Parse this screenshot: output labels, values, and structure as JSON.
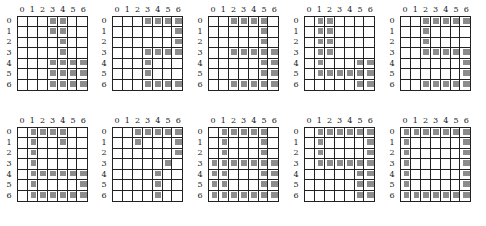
{
  "col_labels": [
    "0",
    "1",
    "2",
    "3",
    "4",
    "5",
    "6"
  ],
  "row_labels": [
    "0",
    "1",
    "2",
    "3",
    "4",
    "5",
    "6"
  ],
  "fill_color": "#8c8c8c",
  "panels": [
    {
      "id": 1,
      "x": 3,
      "y": 5,
      "filled": {
        "0": [
          3,
          4
        ],
        "1": [
          3,
          4
        ],
        "2": [
          4
        ],
        "3": [
          4
        ],
        "4": [
          3,
          4,
          5,
          6
        ],
        "5": [
          3,
          4,
          5,
          6
        ],
        "6": [
          3,
          4,
          5,
          6
        ]
      }
    },
    {
      "id": 2,
      "x": 98,
      "y": 5,
      "filled": {
        "0": [
          3,
          4,
          5,
          6
        ],
        "1": [
          6
        ],
        "2": [
          6
        ],
        "3": [
          3,
          4,
          5,
          6
        ],
        "4": [
          3
        ],
        "5": [
          3
        ],
        "6": [
          3,
          4,
          5,
          6
        ]
      }
    },
    {
      "id": 3,
      "x": 194,
      "y": 5,
      "filled": {
        "0": [
          2,
          3,
          4,
          5
        ],
        "1": [
          5
        ],
        "2": [
          5
        ],
        "3": [
          2,
          3,
          4,
          5,
          6
        ],
        "4": [
          5,
          6
        ],
        "5": [
          5,
          6
        ],
        "6": [
          2,
          3,
          4,
          5,
          6
        ]
      }
    },
    {
      "id": 4,
      "x": 290,
      "y": 5,
      "filled": {
        "0": [
          1,
          2
        ],
        "1": [
          1,
          2
        ],
        "2": [
          1,
          2
        ],
        "3": [
          1,
          2
        ],
        "4": [
          1,
          5,
          6
        ],
        "5": [
          1,
          2,
          3,
          4,
          5,
          6
        ],
        "6": [
          5,
          6
        ]
      }
    },
    {
      "id": 5,
      "x": 386,
      "y": 5,
      "filled": {
        "0": [
          2,
          3,
          4,
          5,
          6
        ],
        "1": [
          2
        ],
        "2": [
          2
        ],
        "3": [
          2,
          3,
          4,
          5,
          6
        ],
        "4": [
          6
        ],
        "5": [
          6
        ],
        "6": [
          2,
          3,
          4,
          5,
          6
        ]
      }
    },
    {
      "id": 6,
      "x": 3,
      "y": 116,
      "filled": {
        "0": [
          1,
          2,
          3,
          4
        ],
        "1": [
          1,
          4
        ],
        "2": [
          1
        ],
        "3": [
          1
        ],
        "4": [
          1,
          2,
          3,
          4,
          5,
          6
        ],
        "5": [
          1,
          6
        ],
        "6": [
          1,
          2,
          3,
          4,
          5,
          6
        ]
      }
    },
    {
      "id": 7,
      "x": 98,
      "y": 116,
      "filled": {
        "0": [
          2,
          3,
          4,
          5,
          6
        ],
        "1": [
          2,
          6
        ],
        "2": [
          6
        ],
        "3": [
          5
        ],
        "4": [
          4
        ],
        "5": [
          4
        ],
        "6": [
          4
        ]
      }
    },
    {
      "id": 8,
      "x": 194,
      "y": 116,
      "filled": {
        "0": [
          1,
          2,
          3,
          4,
          5
        ],
        "1": [
          1,
          5
        ],
        "2": [
          1,
          5
        ],
        "3": [
          0,
          1,
          2,
          3,
          4,
          5,
          6
        ],
        "4": [
          0,
          1,
          5,
          6
        ],
        "5": [
          0,
          1,
          5,
          6
        ],
        "6": [
          0,
          1,
          2,
          3,
          4,
          5,
          6
        ]
      }
    },
    {
      "id": 9,
      "x": 290,
      "y": 116,
      "filled": {
        "0": [
          1,
          2,
          3,
          4,
          5,
          6
        ],
        "1": [
          1,
          6
        ],
        "2": [
          1,
          6
        ],
        "3": [
          1,
          2,
          3,
          4,
          5,
          6
        ],
        "4": [
          5,
          6
        ],
        "5": [
          5,
          6
        ],
        "6": [
          5,
          6
        ]
      }
    },
    {
      "id": 10,
      "x": 386,
      "y": 116,
      "filled": {
        "0": [
          0,
          1,
          2,
          3,
          4,
          5,
          6
        ],
        "1": [
          0,
          6
        ],
        "2": [
          0,
          6
        ],
        "3": [
          0,
          6
        ],
        "4": [
          0,
          6
        ],
        "5": [
          0,
          6
        ],
        "6": [
          0,
          1,
          2,
          3,
          4,
          5,
          6
        ]
      }
    }
  ]
}
